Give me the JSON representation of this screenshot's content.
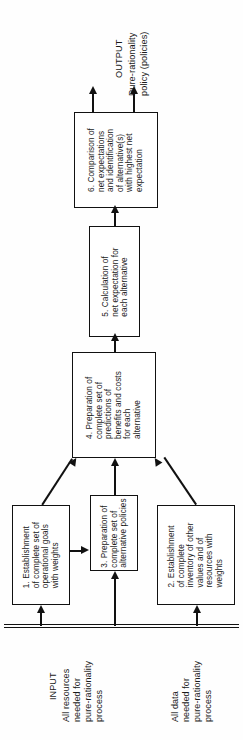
{
  "diagram": {
    "orientation": "rotated-90-ccw",
    "ink_color": "#111111",
    "background_color": "#fefefe"
  },
  "output": {
    "heading": "OUTPUT",
    "line1": "Pure-rationality",
    "line2": "policy (policies)"
  },
  "boxes": {
    "box6": "6. Comparison of\nnet expectations\nand identification\nof alternative(s)\nwith highest net\nexpectation",
    "box5": "5. Calculation of\nnet expectation for\neach alternative",
    "box4": "4. Preparation of\ncomplete set of\npredictions of\nbenefits and costs\nfor each\nalternative",
    "box3": "3. Preparation of\ncomplete set of\nalternative policies",
    "box1": "1. Establishment\nof complete set of\noperational goals\nwith weights",
    "box2": "2. Establishment\nof complete\ninventory of other\nvalues and of\nresources with\nweights"
  },
  "input": {
    "heading": "INPUT",
    "resources": "All resources\nneeded for\npure-rationality\nprocess",
    "data": "All data\nneeded for\npure-rationality\nprocess"
  }
}
